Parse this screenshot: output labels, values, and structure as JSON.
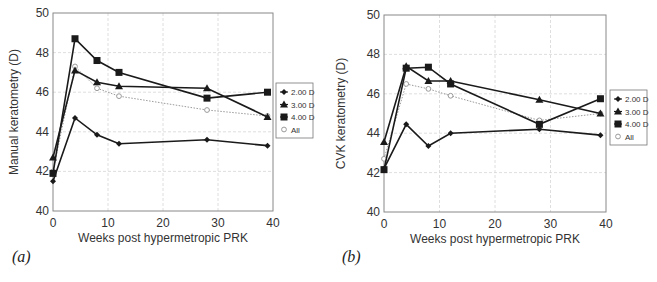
{
  "chart_data": [
    {
      "id": "a",
      "panel_label": "(a)",
      "type": "line",
      "title": "",
      "xlabel": "Weeks post hypermetropic PRK",
      "ylabel": "Manual keratometry (D)",
      "xlim": [
        0,
        40
      ],
      "ylim": [
        40,
        50
      ],
      "xticks": [
        0,
        10,
        20,
        30,
        40
      ],
      "yticks": [
        40,
        42,
        44,
        46,
        48,
        50
      ],
      "grid": true,
      "legend_position": "right",
      "x": [
        0,
        4,
        8,
        12,
        28,
        39
      ],
      "series": [
        {
          "name": "2.00 D",
          "marker": "diamond",
          "color": "#1a1a1a",
          "line": "solid",
          "values": [
            41.5,
            44.7,
            43.85,
            43.4,
            43.6,
            43.3
          ]
        },
        {
          "name": "3.00 D",
          "marker": "triangle",
          "color": "#1a1a1a",
          "line": "solid",
          "values": [
            42.7,
            47.1,
            46.5,
            46.3,
            46.2,
            44.75
          ]
        },
        {
          "name": "4.00 D",
          "marker": "square",
          "color": "#1a1a1a",
          "line": "solid",
          "values": [
            41.9,
            48.7,
            47.6,
            47.0,
            45.7,
            46.0
          ]
        },
        {
          "name": "All",
          "marker": "open-circle",
          "color": "#9a9a9a",
          "line": "dotted",
          "values": [
            42.0,
            47.3,
            46.2,
            45.8,
            45.1,
            44.8
          ]
        }
      ]
    },
    {
      "id": "b",
      "panel_label": "(b)",
      "type": "line",
      "title": "",
      "xlabel": "Weeks post hypermetropic PRK",
      "ylabel": "CVK keratometry (D)",
      "xlim": [
        0,
        40
      ],
      "ylim": [
        40,
        50
      ],
      "xticks": [
        0,
        10,
        20,
        30,
        40
      ],
      "yticks": [
        40,
        42,
        44,
        46,
        48,
        50
      ],
      "grid": true,
      "legend_position": "right",
      "x": [
        0,
        4,
        8,
        12,
        28,
        39
      ],
      "series": [
        {
          "name": "2.00 D",
          "marker": "diamond",
          "color": "#1a1a1a",
          "line": "solid",
          "values": [
            42.2,
            44.45,
            43.35,
            44.0,
            44.2,
            43.9
          ]
        },
        {
          "name": "3.00 D",
          "marker": "triangle",
          "color": "#1a1a1a",
          "line": "solid",
          "values": [
            43.55,
            47.4,
            46.65,
            46.65,
            45.7,
            45.0
          ]
        },
        {
          "name": "4.00 D",
          "marker": "square",
          "color": "#1a1a1a",
          "line": "solid",
          "values": [
            42.15,
            47.3,
            47.35,
            46.5,
            44.45,
            45.75
          ]
        },
        {
          "name": "All",
          "marker": "open-circle",
          "color": "#9a9a9a",
          "line": "dotted",
          "values": [
            42.7,
            46.5,
            46.25,
            45.9,
            44.65,
            45.0
          ]
        }
      ]
    }
  ],
  "panels": {
    "a": {
      "label": "(a)"
    },
    "b": {
      "label": "(b)"
    }
  }
}
